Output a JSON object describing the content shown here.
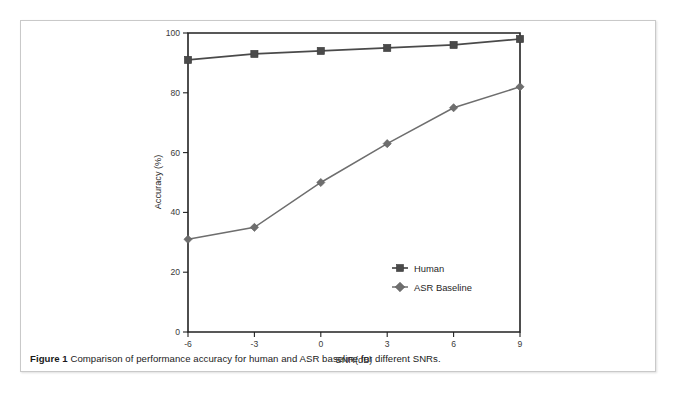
{
  "figure": {
    "caption_label": "Figure 1",
    "caption_text": "Comparison of performance accuracy for human and ASR baseline for different SNRs."
  },
  "chart_data": {
    "type": "line",
    "title": "",
    "xlabel": "SNR(dB)",
    "ylabel": "Accuracy (%)",
    "x": [
      -6,
      -3,
      0,
      3,
      6,
      9
    ],
    "xticklabels": [
      "-6",
      "-3",
      "0",
      "3",
      "6",
      "9"
    ],
    "yticklabels": [
      "0",
      "20",
      "40",
      "60",
      "80",
      "100"
    ],
    "yticks": [
      0,
      20,
      40,
      60,
      80,
      100
    ],
    "xlim": [
      -6,
      9
    ],
    "ylim": [
      0,
      100
    ],
    "grid": false,
    "legend_position": "lower right",
    "series": [
      {
        "name": "Human",
        "marker": "square",
        "color": "#4a4a4a",
        "values": [
          91,
          93,
          94,
          95,
          96,
          98
        ]
      },
      {
        "name": "ASR Baseline",
        "marker": "diamond",
        "color": "#6e6e6e",
        "values": [
          31,
          35,
          50,
          63,
          75,
          82
        ]
      }
    ]
  }
}
